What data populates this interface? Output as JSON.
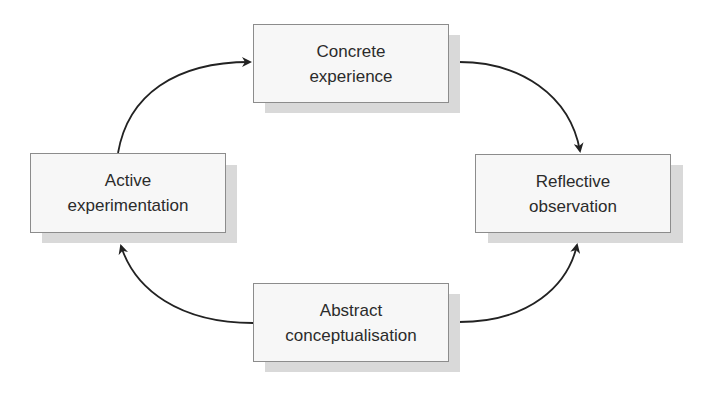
{
  "diagram": {
    "nodes": [
      {
        "id": "top",
        "line1": "Concrete",
        "line2": "experience"
      },
      {
        "id": "right",
        "line1": "Reflective",
        "line2": "observation"
      },
      {
        "id": "bottom",
        "line1": "Abstract",
        "line2": "conceptualisation"
      },
      {
        "id": "left",
        "line1": "Active",
        "line2": "experimentation"
      }
    ],
    "edges": [
      {
        "from": "left",
        "to": "top"
      },
      {
        "from": "top",
        "to": "right"
      },
      {
        "from": "bottom",
        "to": "right"
      },
      {
        "from": "bottom",
        "to": "left"
      }
    ],
    "colors": {
      "box_fill": "#f7f7f7",
      "box_border": "#8c8c8c",
      "shadow": "#d9d9d9",
      "arrow": "#222222",
      "text": "#2b2b2b"
    }
  }
}
